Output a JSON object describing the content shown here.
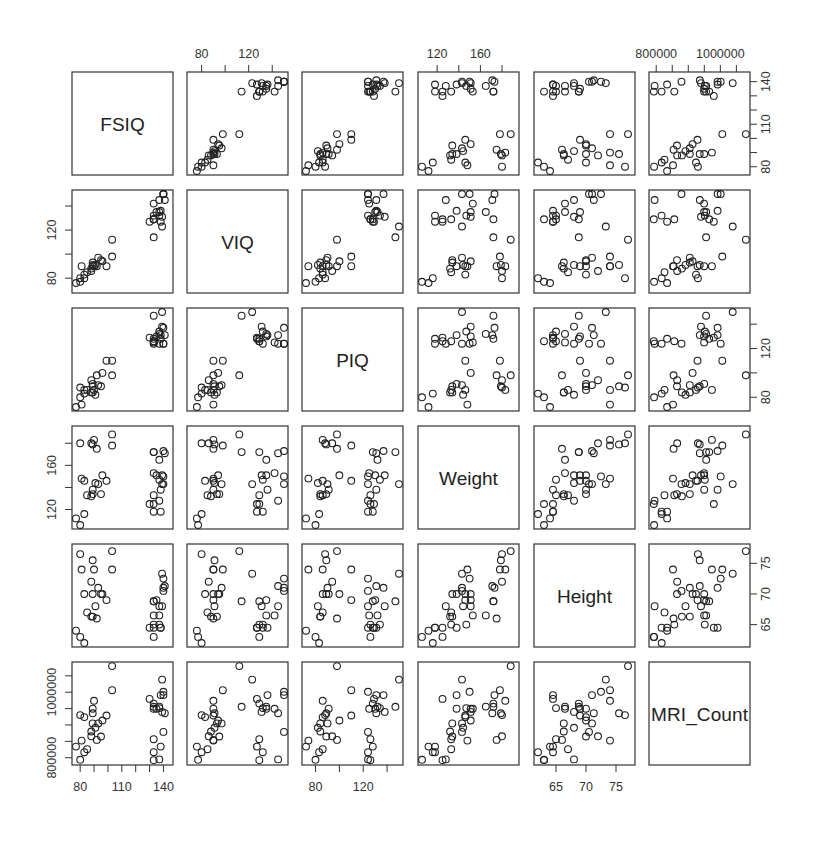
{
  "chart_data": {
    "type": "scatter",
    "subtype": "scatterplot_matrix",
    "title": "",
    "variables": [
      "FSIQ",
      "VIQ",
      "PIQ",
      "Weight",
      "Height",
      "MRI_Count"
    ],
    "diagonal_labels": [
      "FSIQ",
      "VIQ",
      "PIQ",
      "Weight",
      "Height",
      "MRI_Count"
    ],
    "ranges": {
      "FSIQ": [
        77,
        144
      ],
      "VIQ": [
        71,
        150
      ],
      "PIQ": [
        72,
        150
      ],
      "Weight": [
        106,
        192
      ],
      "Height": [
        62,
        77.5
      ],
      "MRI_Count": [
        790000,
        1080000
      ]
    },
    "axes": {
      "top": [
        {
          "col": 1,
          "var": "VIQ",
          "ticks": [
            80,
            100,
            120,
            140
          ],
          "labels": [
            "80",
            "",
            "120",
            ""
          ]
        },
        {
          "col": 3,
          "var": "Weight",
          "ticks": [
            120,
            140,
            160,
            180
          ],
          "labels": [
            "120",
            "",
            "160",
            ""
          ]
        },
        {
          "col": 5,
          "var": "MRI_Count",
          "ticks": [
            800000,
            850000,
            900000,
            950000,
            1000000,
            1050000
          ],
          "labels": [
            "800000",
            "",
            "",
            "",
            "1000000",
            ""
          ]
        }
      ],
      "bottom": [
        {
          "col": 0,
          "var": "FSIQ",
          "ticks": [
            80,
            90,
            100,
            110,
            120,
            130,
            140
          ],
          "labels": [
            "80",
            "",
            "",
            "110",
            "",
            "",
            "140"
          ]
        },
        {
          "col": 2,
          "var": "PIQ",
          "ticks": [
            80,
            100,
            120,
            140
          ],
          "labels": [
            "80",
            "",
            "120",
            ""
          ]
        },
        {
          "col": 4,
          "var": "Height",
          "ticks": [
            65,
            70,
            75
          ],
          "labels": [
            "65",
            "70",
            "75"
          ]
        }
      ],
      "left": [
        {
          "row": 1,
          "var": "VIQ",
          "ticks": [
            80,
            100,
            120,
            140
          ],
          "labels": [
            "80",
            "",
            "120",
            ""
          ]
        },
        {
          "row": 3,
          "var": "Weight",
          "ticks": [
            120,
            140,
            160,
            180
          ],
          "labels": [
            "120",
            "",
            "160",
            ""
          ]
        },
        {
          "row": 5,
          "var": "MRI_Count",
          "ticks": [
            800000,
            850000,
            900000,
            950000,
            1000000,
            1050000
          ],
          "labels": [
            "800000",
            "",
            "",
            "",
            "1000000",
            ""
          ]
        }
      ],
      "right": [
        {
          "row": 0,
          "var": "FSIQ",
          "ticks": [
            80,
            90,
            100,
            110,
            120,
            130,
            140
          ],
          "labels": [
            "80",
            "",
            "",
            "110",
            "",
            "",
            "140"
          ]
        },
        {
          "row": 2,
          "var": "PIQ",
          "ticks": [
            80,
            100,
            120,
            140
          ],
          "labels": [
            "80",
            "",
            "120",
            ""
          ]
        },
        {
          "row": 4,
          "var": "Height",
          "ticks": [
            65,
            70,
            75
          ],
          "labels": [
            "65",
            "70",
            "75"
          ]
        }
      ]
    },
    "observations": [
      {
        "FSIQ": 133,
        "VIQ": 132,
        "PIQ": 124,
        "Weight": 118,
        "Height": 64.5,
        "MRI_Count": 816932
      },
      {
        "FSIQ": 140,
        "VIQ": 150,
        "PIQ": 124,
        "Weight": 150,
        "Height": 72.5,
        "MRI_Count": 1001121
      },
      {
        "FSIQ": 139,
        "VIQ": 123,
        "PIQ": 150,
        "Weight": 143,
        "Height": 73.3,
        "MRI_Count": 1038437
      },
      {
        "FSIQ": 133,
        "VIQ": 129,
        "PIQ": 128,
        "Weight": 172,
        "Height": 68.8,
        "MRI_Count": 965353
      },
      {
        "FSIQ": 137,
        "VIQ": 132,
        "PIQ": 134,
        "Weight": 147,
        "Height": 65.0,
        "MRI_Count": 951545
      },
      {
        "FSIQ": 99,
        "VIQ": 90,
        "PIQ": 110,
        "Weight": 146,
        "Height": 69.0,
        "MRI_Count": 928799
      },
      {
        "FSIQ": 138,
        "VIQ": 136,
        "PIQ": 131,
        "Weight": 138,
        "Height": 64.5,
        "MRI_Count": 991305
      },
      {
        "FSIQ": 92,
        "VIQ": 90,
        "PIQ": 98,
        "Weight": 175,
        "Height": 66.0,
        "MRI_Count": 854258
      },
      {
        "FSIQ": 89,
        "VIQ": 93,
        "PIQ": 84,
        "Weight": 134,
        "Height": 66.3,
        "MRI_Count": 904858
      },
      {
        "FSIQ": 133,
        "VIQ": 114,
        "PIQ": 147,
        "Weight": 172,
        "Height": 68.8,
        "MRI_Count": 955466
      },
      {
        "FSIQ": 138,
        "VIQ": 127,
        "PIQ": 128,
        "Weight": 118,
        "Height": 64.5,
        "MRI_Count": 833868
      },
      {
        "FSIQ": 96,
        "VIQ": 94,
        "PIQ": 100,
        "Weight": 151,
        "Height": 70.0,
        "MRI_Count": 913598
      },
      {
        "FSIQ": 80,
        "VIQ": 80,
        "PIQ": 88,
        "Weight": 180,
        "Height": 76.5,
        "MRI_Count": 930016
      },
      {
        "FSIQ": 139,
        "VIQ": 131,
        "PIQ": 138,
        "Weight": 151,
        "Height": 68.0,
        "MRI_Count": 939807
      },
      {
        "FSIQ": 133,
        "VIQ": 129,
        "PIQ": 126,
        "Weight": 125,
        "Height": 63.0,
        "MRI_Count": 792351
      },
      {
        "FSIQ": 137,
        "VIQ": 145,
        "PIQ": 124,
        "Weight": 128,
        "Height": 68.0,
        "MRI_Count": 794926
      },
      {
        "FSIQ": 137,
        "VIQ": 135,
        "PIQ": 132,
        "Weight": 165,
        "Height": 66.5,
        "MRI_Count": 956002
      },
      {
        "FSIQ": 130,
        "VIQ": 127,
        "PIQ": 129,
        "Weight": 125,
        "Height": 64.5,
        "MRI_Count": 979557
      },
      {
        "FSIQ": 90,
        "VIQ": 90,
        "PIQ": 86,
        "Weight": 183,
        "Height": 74.0,
        "MRI_Count": 973801
      },
      {
        "FSIQ": 103,
        "VIQ": 112,
        "PIQ": 98,
        "Weight": 188,
        "Height": 77.0,
        "MRI_Count": 1079549
      },
      {
        "FSIQ": 83,
        "VIQ": 83,
        "PIQ": 86,
        "Weight": 146,
        "Height": 70.0,
        "MRI_Count": 924059
      },
      {
        "FSIQ": 133,
        "VIQ": 129,
        "PIQ": 126,
        "Weight": 133,
        "Height": 65.0,
        "MRI_Count": 856472
      },
      {
        "FSIQ": 140,
        "VIQ": 150,
        "PIQ": 124,
        "Weight": 143,
        "Height": 70.5,
        "MRI_Count": 878897
      },
      {
        "FSIQ": 88,
        "VIQ": 86,
        "PIQ": 94,
        "Weight": 180,
        "Height": 72.0,
        "MRI_Count": 865363
      },
      {
        "FSIQ": 81,
        "VIQ": 90,
        "PIQ": 74,
        "Weight": 148,
        "Height": 74.0,
        "MRI_Count": 852244
      },
      {
        "FSIQ": 89,
        "VIQ": 91,
        "PIQ": 89,
        "Weight": 179,
        "Height": 75.5,
        "MRI_Count": 935494
      },
      {
        "FSIQ": 89,
        "VIQ": 90,
        "PIQ": 91,
        "Weight": 138,
        "Height": 70.0,
        "MRI_Count": 949589
      },
      {
        "FSIQ": 133,
        "VIQ": 142,
        "PIQ": 125,
        "Weight": 153,
        "Height": 66.5,
        "MRI_Count": 949395
      },
      {
        "FSIQ": 141,
        "VIQ": 145,
        "PIQ": 131,
        "Weight": 171,
        "Height": 71.3,
        "MRI_Count": 935863
      },
      {
        "FSIQ": 135,
        "VIQ": 135,
        "PIQ": 130,
        "Weight": 151,
        "Height": 69.0,
        "MRI_Count": 949394
      },
      {
        "FSIQ": 140,
        "VIQ": 150,
        "PIQ": 137,
        "Weight": 173,
        "Height": 71.0,
        "MRI_Count": 991305
      },
      {
        "FSIQ": 93,
        "VIQ": 97,
        "PIQ": 90,
        "Weight": 143,
        "Height": 71.0,
        "MRI_Count": 904858
      },
      {
        "FSIQ": 95,
        "VIQ": 95,
        "PIQ": 89,
        "Weight": 134,
        "Height": 70.0,
        "MRI_Count": 864830
      },
      {
        "FSIQ": 103,
        "VIQ": 98,
        "PIQ": 110,
        "Weight": 178,
        "Height": 74.0,
        "MRI_Count": 1006251
      },
      {
        "FSIQ": 80,
        "VIQ": 77,
        "PIQ": 80,
        "Weight": 106,
        "Height": 63.0,
        "MRI_Count": 793549
      },
      {
        "FSIQ": 83,
        "VIQ": 80,
        "PIQ": 83,
        "Weight": 116,
        "Height": 62.0,
        "MRI_Count": 817006
      },
      {
        "FSIQ": 85,
        "VIQ": 85,
        "PIQ": 86,
        "Weight": 133,
        "Height": 67.0,
        "MRI_Count": 825936
      },
      {
        "FSIQ": 88,
        "VIQ": 88,
        "PIQ": 84,
        "Weight": 132,
        "Height": 66.3,
        "MRI_Count": 880040
      },
      {
        "FSIQ": 91,
        "VIQ": 91,
        "PIQ": 82,
        "Weight": 144,
        "Height": 68.0,
        "MRI_Count": 891236
      },
      {
        "FSIQ": 77,
        "VIQ": 76,
        "PIQ": 72,
        "Weight": 112,
        "Height": 64.0,
        "MRI_Count": 833868
      }
    ],
    "layout": {
      "grid": "6x6",
      "panel_x": [
        72,
        187,
        302,
        418,
        534,
        649
      ],
      "panel_y": [
        72,
        190,
        308,
        426,
        544,
        662
      ],
      "panel_w": 101,
      "panel_h": 103,
      "marker": "open-circle",
      "gridlines": false,
      "legend": false
    }
  }
}
